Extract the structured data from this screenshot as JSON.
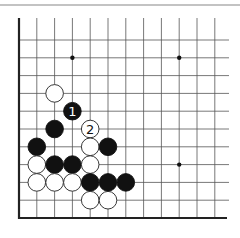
{
  "diagram": {
    "type": "go-board-fragment",
    "colors": {
      "background": "#ffffff",
      "grid_line": "#555555",
      "edge_line": "#222222",
      "header_rule": "#888888",
      "black_stone": "#111111",
      "white_stone_fill": "#ffffff",
      "white_stone_stroke": "#222222",
      "star_point": "#111111"
    },
    "geometry": {
      "origin_x": 19,
      "origin_y": 218,
      "spacing": 17.8,
      "cols": 12,
      "rows": 11,
      "top_extent_y": 18,
      "right_extent_x": 229,
      "stone_radius": 8.8,
      "header_rule_y": 5
    },
    "edges": [
      "left",
      "bottom"
    ],
    "star_points": [
      {
        "col": 3,
        "row": 9
      },
      {
        "col": 9,
        "row": 9
      },
      {
        "col": 9,
        "row": 3
      }
    ],
    "stones": [
      {
        "color": "white",
        "col": 2,
        "row": 7,
        "label": ""
      },
      {
        "color": "black",
        "col": 3,
        "row": 6,
        "label": "1"
      },
      {
        "color": "black",
        "col": 2,
        "row": 5,
        "label": ""
      },
      {
        "color": "white",
        "col": 4,
        "row": 5,
        "label": "2"
      },
      {
        "color": "black",
        "col": 1,
        "row": 4,
        "label": ""
      },
      {
        "color": "white",
        "col": 4,
        "row": 4,
        "label": ""
      },
      {
        "color": "black",
        "col": 5,
        "row": 4,
        "label": ""
      },
      {
        "color": "white",
        "col": 1,
        "row": 3,
        "label": ""
      },
      {
        "color": "black",
        "col": 2,
        "row": 3,
        "label": ""
      },
      {
        "color": "black",
        "col": 3,
        "row": 3,
        "label": ""
      },
      {
        "color": "white",
        "col": 4,
        "row": 3,
        "label": ""
      },
      {
        "color": "white",
        "col": 1,
        "row": 2,
        "label": ""
      },
      {
        "color": "white",
        "col": 2,
        "row": 2,
        "label": ""
      },
      {
        "color": "white",
        "col": 3,
        "row": 2,
        "label": ""
      },
      {
        "color": "black",
        "col": 4,
        "row": 2,
        "label": ""
      },
      {
        "color": "black",
        "col": 5,
        "row": 2,
        "label": ""
      },
      {
        "color": "black",
        "col": 6,
        "row": 2,
        "label": ""
      },
      {
        "color": "white",
        "col": 4,
        "row": 1,
        "label": ""
      },
      {
        "color": "white",
        "col": 5,
        "row": 1,
        "label": ""
      }
    ]
  }
}
